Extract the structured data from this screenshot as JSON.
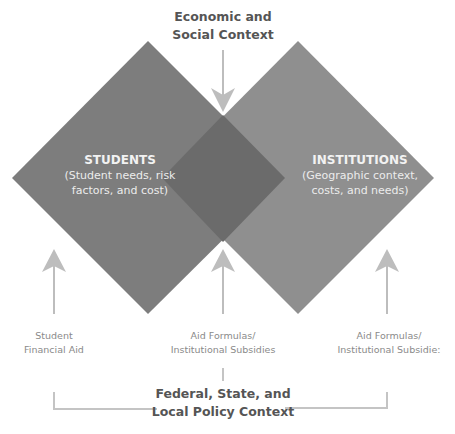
{
  "top_context": {
    "line1": "Economic and",
    "line2": "Social Context"
  },
  "students": {
    "title": "STUDENTS",
    "sub_line1": "(Student needs, risk",
    "sub_line2": "factors, and cost)"
  },
  "institutions": {
    "title": "INSTITUTIONS",
    "sub_line1": "(Geographic context,",
    "sub_line2": "costs, and needs)"
  },
  "arrows": [
    {
      "line1": "Student",
      "line2": "Financial Aid"
    },
    {
      "line1": "Aid Formulas/",
      "line2": "Institutional Subsidies"
    },
    {
      "line1": "Aid Formulas/",
      "line2": "Institutional Subsidie:"
    }
  ],
  "bottom_context": {
    "line1": "Federal, State, and",
    "line2": "Local Policy Context"
  },
  "colors": {
    "students_fill": "#7a7a7a",
    "institutions_fill": "#8c8c8c",
    "overlap_fill": "#6a6a6a",
    "arrow": "#bdbdbd",
    "bracket": "#c4c4c4",
    "context_text": "#555555",
    "aid_text": "#8a8a8a"
  }
}
